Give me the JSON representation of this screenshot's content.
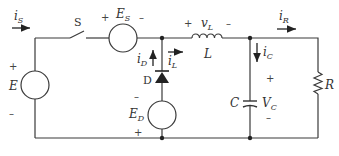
{
  "diagram": {
    "type": "circuit",
    "title": "",
    "components": [
      {
        "id": "E",
        "kind": "voltage-source",
        "label": "E",
        "plus": "+",
        "minus": "–"
      },
      {
        "id": "S",
        "kind": "switch",
        "label": "S"
      },
      {
        "id": "ES",
        "kind": "voltage-source",
        "label": "E",
        "sub": "S",
        "plus": "+",
        "minus": "–"
      },
      {
        "id": "D",
        "kind": "diode",
        "label": "D"
      },
      {
        "id": "ED",
        "kind": "voltage-source",
        "label": "E",
        "sub": "D",
        "plus": "+",
        "minus": "–"
      },
      {
        "id": "L",
        "kind": "inductor",
        "label": "L",
        "voltage_label": "v",
        "voltage_sub": "L",
        "plus": "+",
        "minus": "–"
      },
      {
        "id": "C",
        "kind": "capacitor",
        "label": "C",
        "voltage_label": "V",
        "voltage_sub": "C",
        "plus": "+",
        "minus": "–"
      },
      {
        "id": "R",
        "kind": "resistor",
        "label": "R"
      }
    ],
    "currents": [
      {
        "id": "iS",
        "label": "i",
        "sub": "S",
        "direction": "right"
      },
      {
        "id": "iD",
        "label": "i",
        "sub": "D",
        "direction": "up"
      },
      {
        "id": "iL",
        "label": "i",
        "sub": "L",
        "direction": "right"
      },
      {
        "id": "iC",
        "label": "i",
        "sub": "C",
        "direction": "down"
      },
      {
        "id": "iR",
        "label": "i",
        "sub": "R",
        "direction": "right"
      }
    ]
  }
}
